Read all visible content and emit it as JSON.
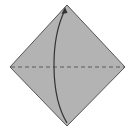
{
  "diagram": {
    "type": "origami-fold-step",
    "paper": {
      "shape": "square-rotated-45",
      "fill": "#b3b3b3",
      "stroke": "#555555",
      "vertices": {
        "top": [
          67,
          5
        ],
        "right": [
          125,
          67
        ],
        "bottom": [
          67,
          126
        ],
        "left": [
          10,
          67
        ]
      }
    },
    "valley_fold_line": {
      "style": "dashed",
      "color": "#5a5a5a",
      "from": [
        10,
        67
      ],
      "to": [
        125,
        67
      ]
    },
    "fold_arrow": {
      "color": "#333333",
      "from": [
        67,
        123
      ],
      "to": [
        65,
        9
      ],
      "curve": "bulges-left",
      "head": "top"
    }
  }
}
